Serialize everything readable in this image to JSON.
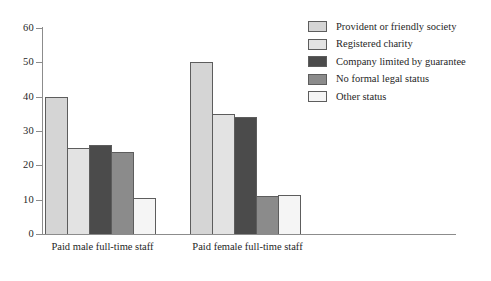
{
  "chart_data": {
    "type": "bar",
    "title": "",
    "subtitle": "",
    "xlabel": "",
    "ylabel": "",
    "ylim": [
      0,
      60
    ],
    "yticks": [
      0,
      10,
      20,
      30,
      40,
      50,
      60
    ],
    "ytick_labels": [
      "0",
      "10",
      "20",
      "30",
      "40",
      "50",
      "60"
    ],
    "grid": false,
    "legend_position": "top-right",
    "categories": [
      "Paid male full-time staff",
      "Paid female full-time staff"
    ],
    "series": [
      {
        "name": "Provident or friendly society",
        "color": "#d5d5d5",
        "values": [
          40,
          50
        ]
      },
      {
        "name": "Registered charity",
        "color": "#e3e3e3",
        "values": [
          25,
          35
        ]
      },
      {
        "name": "Company limited by guarantee",
        "color": "#4b4b4b",
        "values": [
          26,
          34
        ]
      },
      {
        "name": "No formal legal status",
        "color": "#8b8b8b",
        "values": [
          24,
          11
        ]
      },
      {
        "name": "Other status",
        "color": "#f5f5f5",
        "values": [
          10.5,
          11.5
        ]
      }
    ]
  },
  "legend": {
    "items": [
      {
        "label": "Provident or friendly society",
        "color": "#d5d5d5"
      },
      {
        "label": "Registered charity",
        "color": "#e3e3e3"
      },
      {
        "label": "Company limited by guarantee",
        "color": "#4b4b4b"
      },
      {
        "label": "No formal legal status",
        "color": "#8b8b8b"
      },
      {
        "label": "Other status",
        "color": "#f5f5f5"
      }
    ]
  },
  "axis": {
    "border_color": "#8c8c8c",
    "bar_border_color": "#5d5d5d"
  }
}
